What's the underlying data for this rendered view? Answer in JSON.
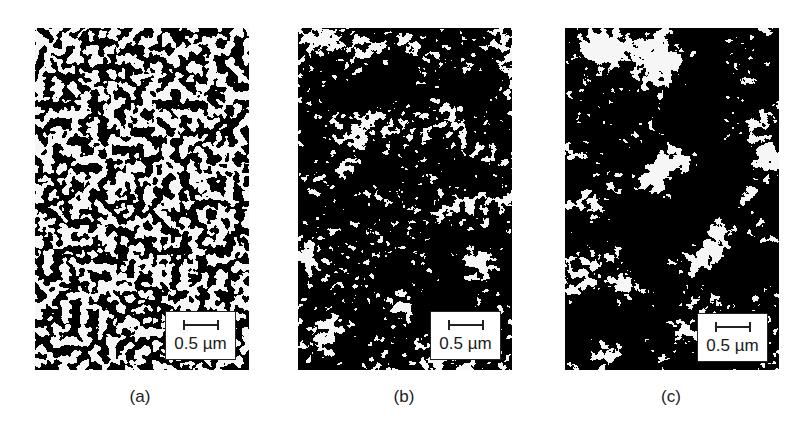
{
  "figure": {
    "panels": [
      {
        "id": "a",
        "label": "(a)",
        "scale_bar": "0.5 µm",
        "texture": "fine dense dark network"
      },
      {
        "id": "b",
        "label": "(b)",
        "scale_bar": "0.5 µm",
        "texture": "medium clustered dark network"
      },
      {
        "id": "c",
        "label": "(c)",
        "scale_bar": "0.5 µm",
        "texture": "coarse aggregated dark network"
      }
    ],
    "colors": {
      "dark_phase": "#0a0a0a",
      "light_phase": "#f6f6f6",
      "frame": "#222222"
    }
  }
}
